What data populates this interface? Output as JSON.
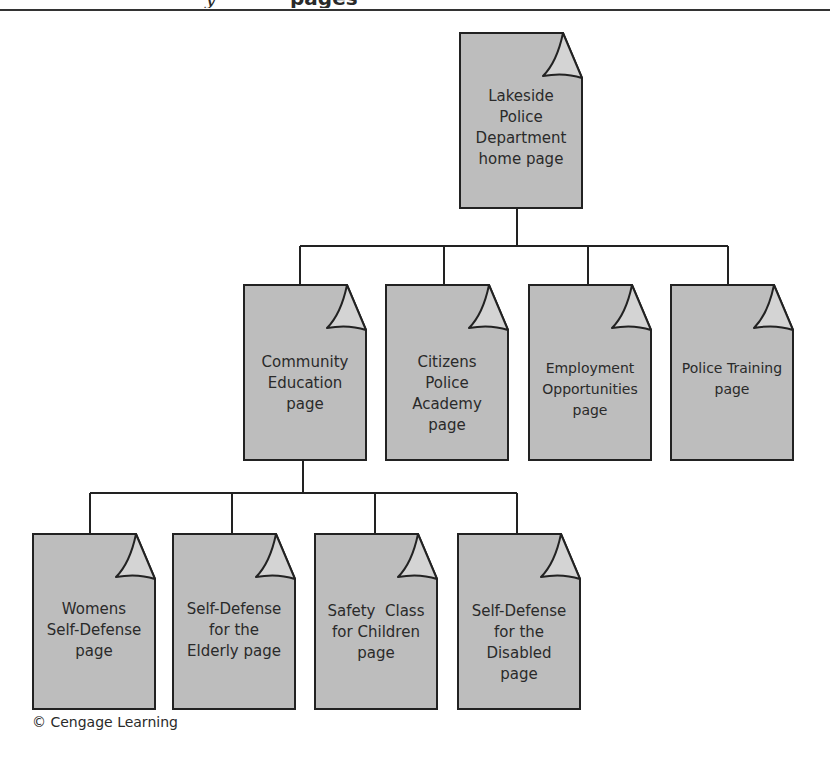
{
  "header": {
    "clipped_text_left": "y",
    "clipped_text_right": "pages"
  },
  "diagram": {
    "type": "site-hierarchy",
    "colors": {
      "page_fill": "#bdbdbd",
      "fold_fill": "#d4d4d4",
      "stroke": "#222222"
    },
    "root": {
      "label_lines": [
        "Lakeside",
        "Police",
        "Department",
        "home page"
      ]
    },
    "level1": [
      {
        "label_lines": [
          "Community",
          "Education",
          "page"
        ]
      },
      {
        "label_lines": [
          "Citizens",
          "Police",
          "Academy",
          "page"
        ]
      },
      {
        "label_lines": [
          "Employment",
          "Opportunities",
          "page"
        ]
      },
      {
        "label_lines": [
          "Police Training",
          "page"
        ]
      }
    ],
    "level2": [
      {
        "label_lines": [
          "Womens",
          "Self-Defense",
          "page"
        ]
      },
      {
        "label_lines": [
          "Self-Defense",
          "for the",
          "Elderly page"
        ]
      },
      {
        "label_lines": [
          "Safety  Class",
          "for Children",
          "page"
        ]
      },
      {
        "label_lines": [
          "Self-Defense",
          "for the",
          "Disabled",
          "page"
        ]
      }
    ]
  },
  "footer": {
    "credit": "© Cengage Learning"
  }
}
